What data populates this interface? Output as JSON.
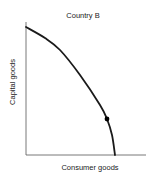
{
  "chart_data": {
    "type": "line",
    "title": "Country B",
    "xlabel": "Consumer goods",
    "ylabel": "Capital goods",
    "grid": false,
    "legend": null,
    "series": [
      {
        "name": "Production possibilities frontier",
        "shape": "concave curve",
        "points_px": [
          [
            26,
            27
          ],
          [
            45,
            38
          ],
          [
            60,
            50
          ],
          [
            80,
            75
          ],
          [
            100,
            105
          ],
          [
            107,
            119
          ],
          [
            112,
            135
          ],
          [
            115,
            155
          ]
        ],
        "color": "#1a1a1a"
      }
    ],
    "annotations": [
      {
        "type": "point",
        "x_px": 107,
        "y_px": 119,
        "label": ""
      }
    ],
    "axes": {
      "origin_px": [
        26,
        155
      ],
      "x_end_px": 146,
      "y_top_px": 22,
      "ticks": "none"
    }
  }
}
